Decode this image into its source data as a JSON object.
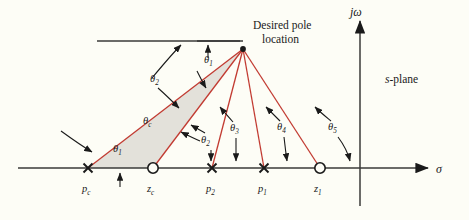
{
  "figure": {
    "background_color": "#fdfdf6",
    "vector_color": "#c23b32",
    "axis_color": "#3a3a38",
    "shade_color": "#dedcd5"
  },
  "labels": {
    "desired_pole_line1": "Desired pole",
    "desired_pole_line2": "location",
    "s_plane": "s-plane",
    "jomega_axis": "jω",
    "sigma_axis": "σ"
  },
  "angles": [
    {
      "id": "theta-c",
      "base": "θ",
      "sub": "c",
      "x": 143,
      "y": 124
    },
    {
      "id": "theta-1a",
      "base": "θ",
      "sub": "1",
      "x": 204,
      "y": 63
    },
    {
      "id": "theta-2a",
      "base": "θ",
      "sub": "2",
      "x": 150,
      "y": 82
    },
    {
      "id": "theta-1b",
      "base": "θ",
      "sub": "1",
      "x": 113,
      "y": 152
    },
    {
      "id": "theta-2b",
      "base": "θ",
      "sub": "2",
      "x": 201,
      "y": 143
    },
    {
      "id": "theta-3",
      "base": "θ",
      "sub": "3",
      "x": 236,
      "y": 131
    },
    {
      "id": "theta-4",
      "base": "θ",
      "sub": "4",
      "x": 282,
      "y": 130
    },
    {
      "id": "theta-5",
      "base": "θ",
      "sub": "5",
      "x": 334,
      "y": 130
    }
  ],
  "real_axis_points": [
    {
      "id": "pc",
      "base": "p",
      "sub": "c",
      "kind": "pole",
      "x": 88,
      "label_x": 85,
      "label_y": 192
    },
    {
      "id": "zc",
      "base": "z",
      "sub": "c",
      "kind": "zero",
      "x": 153,
      "label_x": 149,
      "label_y": 192
    },
    {
      "id": "p2",
      "base": "p",
      "sub": "2",
      "kind": "pole",
      "x": 212,
      "label_x": 208,
      "label_y": 192
    },
    {
      "id": "p1",
      "base": "p",
      "sub": "1",
      "kind": "pole",
      "x": 264,
      "label_x": 260,
      "label_y": 192
    },
    {
      "id": "z1",
      "base": "z",
      "sub": "1",
      "kind": "zero",
      "x": 320,
      "label_x": 316,
      "label_y": 192
    }
  ],
  "geometry": {
    "pole_point": {
      "x": 243,
      "y": 49
    },
    "real_axis_y": 168,
    "real_axis_x_start": 18,
    "real_axis_x_end": 430,
    "jomega_axis_x": 360,
    "jomega_axis_y_top": 20,
    "jomega_axis_y_bottom": 206,
    "ref_line_y": 41,
    "ref_line_x_start": 97,
    "ref_line_x_end": 243
  }
}
